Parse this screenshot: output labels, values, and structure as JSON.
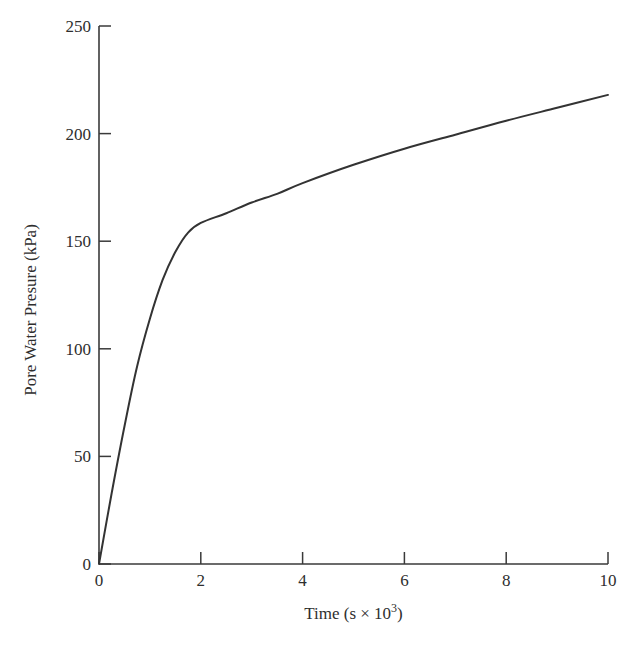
{
  "chart_data": {
    "type": "line",
    "title": "",
    "xlabel": "Time (s × 10³)",
    "xlabel_parts": {
      "main": "Time (s × 10",
      "sup": "3",
      "close": ")"
    },
    "ylabel": "Pore Water Presure (kPa)",
    "xlim": [
      0,
      10
    ],
    "ylim": [
      0,
      250
    ],
    "xticks": [
      0,
      2,
      4,
      6,
      8,
      10
    ],
    "yticks": [
      0,
      50,
      100,
      150,
      200,
      250
    ],
    "grid": false,
    "legend": null,
    "series": [
      {
        "name": "Pore water pressure",
        "color": "#333333",
        "x": [
          0,
          0.25,
          0.5,
          0.75,
          1.0,
          1.25,
          1.5,
          1.75,
          2.0,
          2.5,
          3.0,
          3.5,
          4.0,
          5.0,
          6.0,
          7.0,
          8.0,
          9.0,
          10.0
        ],
        "y": [
          0,
          33,
          64,
          92,
          114,
          132,
          145,
          154,
          158.5,
          163,
          168,
          172,
          177,
          185.5,
          193,
          199.5,
          206,
          212,
          218
        ]
      }
    ]
  },
  "layout": {
    "plot": {
      "x0": 99,
      "y0": 564,
      "x1": 608,
      "y1": 26
    }
  }
}
